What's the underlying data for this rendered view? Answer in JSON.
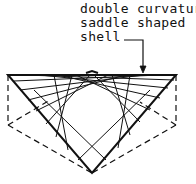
{
  "figure": {
    "annotation": {
      "lines": [
        "double curvature",
        "saddle shaped",
        "shell"
      ]
    },
    "colors": {
      "ink": "#111111",
      "background": "#ffffff"
    }
  }
}
